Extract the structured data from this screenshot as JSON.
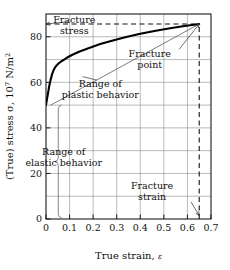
{
  "chart_data": {
    "type": "line",
    "title": "",
    "xlabel": "True strain, ε",
    "ylabel": "(True) stress σ, 10⁷ N/m²",
    "ylabel_parts": {
      "lead": "(True) stress σ, 10",
      "exponent": "7",
      "tail": " N/m",
      "unit_exponent": "2"
    },
    "xlabel_parts": {
      "lead": "True strain, ",
      "symbol": "ε"
    },
    "xlim": [
      0,
      0.7
    ],
    "ylim": [
      0,
      90
    ],
    "grid": true,
    "grid_x_step": 0.1,
    "grid_y_step": 10,
    "xticks": [
      0,
      0.1,
      0.2,
      0.3,
      0.4,
      0.5,
      0.6,
      0.7
    ],
    "xtick_labels": [
      "0",
      "0.1",
      "0.2",
      "0.3",
      "0.4",
      "0.5",
      "0.6",
      "0.7"
    ],
    "yticks": [
      0,
      20,
      40,
      60,
      80
    ],
    "ytick_labels": [
      "0",
      "20",
      "40",
      "60",
      "80"
    ],
    "legend": "none",
    "series": [
      {
        "name": "true stress-strain curve",
        "style": "solid-thick",
        "color": "#000000",
        "x": [
          0,
          0.004,
          0.009,
          0.014,
          0.02,
          0.026,
          0.032,
          0.038,
          0.044,
          0.05,
          0.057,
          0.065,
          0.075,
          0.09,
          0.11,
          0.14,
          0.18,
          0.23,
          0.28,
          0.34,
          0.4,
          0.46,
          0.52,
          0.58,
          0.62,
          0.65
        ],
        "y": [
          50,
          52.5,
          55.5,
          58.5,
          61.3,
          63.6,
          65.3,
          66.5,
          67.3,
          68.0,
          68.6,
          69.2,
          69.9,
          70.9,
          72.0,
          73.4,
          75.0,
          76.8,
          78.3,
          79.9,
          81.3,
          82.5,
          83.6,
          84.6,
          85.2,
          85.6
        ]
      },
      {
        "name": "plastic range chord line",
        "style": "solid-thin",
        "color": "#444444",
        "x": [
          0.02,
          0.65
        ],
        "y": [
          50,
          85.6
        ]
      }
    ],
    "annotations": [
      {
        "id": "fracture-stress",
        "text_lines": [
          "Fracture",
          "stress"
        ],
        "text_x": 0.12,
        "text_y": 86,
        "target_x": 0.0,
        "target_y": 85.6,
        "arrow": true
      },
      {
        "id": "fracture-point",
        "text_lines": [
          "Fracture",
          "point"
        ],
        "text_x": 0.44,
        "text_y": 71,
        "target_x": 0.65,
        "target_y": 85.6,
        "arrow": true
      },
      {
        "id": "range-plastic",
        "text_lines": [
          "Range of",
          "plastic behavior"
        ],
        "text_x": 0.23,
        "text_y": 58,
        "target_x": 0.155,
        "target_y": 62.5,
        "arrow": false
      },
      {
        "id": "range-elastic",
        "text_lines": [
          "Range of",
          "elastic behavior"
        ],
        "text_x": 0.075,
        "text_y": 28,
        "target_x": 0.05,
        "target_y": 28,
        "arrow": false
      },
      {
        "id": "fracture-strain",
        "text_lines": [
          "Fracture",
          "strain"
        ],
        "text_x": 0.45,
        "text_y": 13,
        "target_x": 0.65,
        "target_y": 1.5,
        "arrow": true
      }
    ],
    "reference_lines": [
      {
        "id": "fracture-stress-level",
        "orientation": "horizontal",
        "value": 85.6,
        "style": "dashed",
        "from": 0.0,
        "to": 0.65
      },
      {
        "id": "fracture-strain-level",
        "orientation": "vertical",
        "value": 0.65,
        "style": "dashed",
        "from": 0,
        "to": 85.6
      }
    ],
    "braces": [
      {
        "id": "elastic-brace",
        "x": 0.052,
        "y_from": 0.5,
        "y_to": 50,
        "label_ref": "range-elastic"
      }
    ],
    "colors": {
      "curve": "#000000",
      "chord": "#444444",
      "grid": "#8c8c8c",
      "frame": "#1a1a1a",
      "text": "#111111",
      "background": "#ffffff"
    }
  },
  "figure": {
    "tick_labels_x": [
      "0",
      "0.1",
      "0.2",
      "0.3",
      "0.4",
      "0.5",
      "0.6",
      "0.7"
    ],
    "tick_labels_y": [
      "0",
      "20",
      "40",
      "60",
      "80"
    ]
  }
}
